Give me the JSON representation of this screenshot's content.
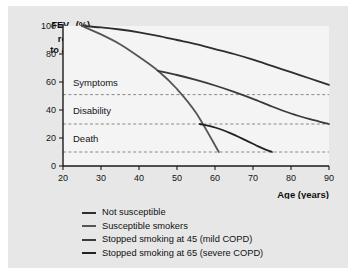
{
  "figure": {
    "background": "#e7e7e7",
    "plot_background": "#f4f4f4"
  },
  "y_axis_label_html": "FEV",
  "y_axis_label_sub": "1",
  "y_axis_label_rest": " (%)",
  "y_axis_label_line2": "relative",
  "y_axis_label_line3": "to age 25",
  "x_axis_title": "Age (years)",
  "zone_labels": [
    {
      "name": "symptoms",
      "text": "Symptoms"
    },
    {
      "name": "disability",
      "text": "Disability"
    },
    {
      "name": "death",
      "text": "Death"
    }
  ],
  "legend": {
    "items": [
      {
        "label": "Not susceptible",
        "color": "#2e2e2e"
      },
      {
        "label": "Susceptible smokers",
        "color": "#555555"
      },
      {
        "label": "Stopped smoking at 45 (mild COPD)",
        "color": "#3a3a3a"
      },
      {
        "label": "Stopped smoking at 65 (severe COPD)",
        "color": "#222222"
      }
    ]
  },
  "chart_data": {
    "type": "line",
    "title": "",
    "xlabel": "Age (years)",
    "ylabel": "FEV1 (%) relative to age 25",
    "xlim": [
      20,
      90
    ],
    "ylim": [
      0,
      100
    ],
    "xticks": [
      20,
      30,
      40,
      50,
      60,
      70,
      80,
      90
    ],
    "yticks": [
      0,
      20,
      40,
      60,
      80,
      100
    ],
    "grid": false,
    "legend_position": "below-axes-left",
    "threshold_lines": [
      {
        "label": "Symptoms",
        "y": 51
      },
      {
        "label": "Disability",
        "y": 30
      },
      {
        "label": "Death",
        "y": 10
      }
    ],
    "series": [
      {
        "name": "Not susceptible",
        "color": "#2e2e2e",
        "x": [
          25,
          30,
          35,
          40,
          45,
          50,
          55,
          60,
          65,
          70,
          75,
          80,
          85,
          90
        ],
        "y": [
          100,
          99,
          97.5,
          95.5,
          93,
          90,
          87,
          83.5,
          80,
          76,
          71.5,
          67,
          62.5,
          58
        ]
      },
      {
        "name": "Susceptible smokers",
        "color": "#555555",
        "x": [
          25,
          30,
          35,
          40,
          45,
          50,
          55,
          61
        ],
        "y": [
          100,
          94,
          87,
          78,
          68,
          55,
          38,
          10
        ]
      },
      {
        "name": "Stopped smoking at 45 (mild COPD)",
        "color": "#3a3a3a",
        "x": [
          45,
          50,
          55,
          60,
          65,
          70,
          75,
          80,
          85,
          90
        ],
        "y": [
          68,
          65,
          61.5,
          57.5,
          53,
          48,
          42.5,
          37.5,
          33.5,
          30
        ]
      },
      {
        "name": "Stopped smoking at 65 (severe COPD)",
        "color": "#222222",
        "x": [
          56,
          60,
          64,
          68,
          71,
          73,
          75
        ],
        "y": [
          30,
          27.5,
          23.5,
          18.5,
          14.5,
          12,
          10
        ]
      }
    ]
  }
}
